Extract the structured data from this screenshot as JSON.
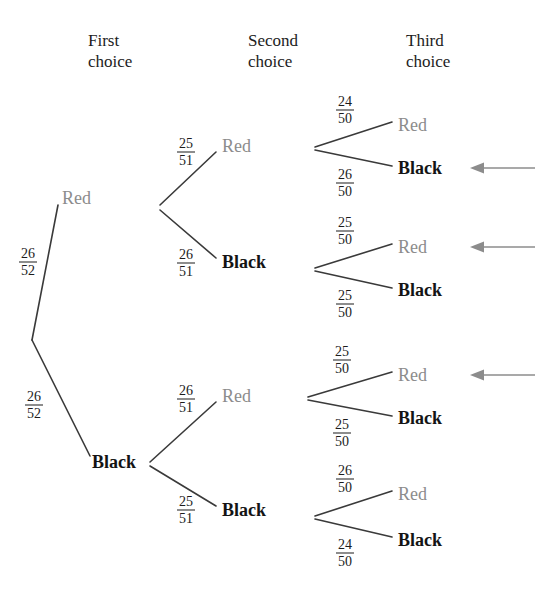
{
  "diagram": {
    "headers": [
      {
        "id": "first",
        "label": "First\nchoice",
        "x": 88,
        "y": 30
      },
      {
        "id": "second",
        "label": "Second\nchoice",
        "x": 248,
        "y": 30
      },
      {
        "id": "third",
        "label": "Third\nchoice",
        "x": 406,
        "y": 30
      }
    ],
    "colors": {
      "red_label": "#8c8c8c",
      "black_label": "#141414",
      "branch_line": "#3a3a3a",
      "arrow": "#8c8c8c",
      "background": "#ffffff"
    },
    "root": {
      "x": 32,
      "y": 340
    },
    "nodes": [
      {
        "id": "n1-red",
        "label": "Red",
        "kind": "red",
        "x": 62,
        "y": 198,
        "level": 1
      },
      {
        "id": "n1-black",
        "label": "Black",
        "kind": "black",
        "x": 92,
        "y": 462,
        "level": 1
      },
      {
        "id": "n2-rr",
        "label": "Red",
        "kind": "red",
        "x": 222,
        "y": 146,
        "level": 2
      },
      {
        "id": "n2-rb",
        "label": "Black",
        "kind": "black",
        "x": 222,
        "y": 262,
        "level": 2
      },
      {
        "id": "n2-br",
        "label": "Red",
        "kind": "red",
        "x": 222,
        "y": 396,
        "level": 2
      },
      {
        "id": "n2-bb",
        "label": "Black",
        "kind": "black",
        "x": 222,
        "y": 510,
        "level": 2
      },
      {
        "id": "n3-rrr",
        "label": "Red",
        "kind": "red",
        "x": 398,
        "y": 125,
        "level": 3
      },
      {
        "id": "n3-rrb",
        "label": "Black",
        "kind": "black",
        "x": 398,
        "y": 168,
        "level": 3
      },
      {
        "id": "n3-rbr",
        "label": "Red",
        "kind": "red",
        "x": 398,
        "y": 247,
        "level": 3
      },
      {
        "id": "n3-rbb",
        "label": "Black",
        "kind": "black",
        "x": 398,
        "y": 290,
        "level": 3
      },
      {
        "id": "n3-brr",
        "label": "Red",
        "kind": "red",
        "x": 398,
        "y": 375,
        "level": 3
      },
      {
        "id": "n3-brb",
        "label": "Black",
        "kind": "black",
        "x": 398,
        "y": 418,
        "level": 3
      },
      {
        "id": "n3-bbr",
        "label": "Red",
        "kind": "red",
        "x": 398,
        "y": 494,
        "level": 3
      },
      {
        "id": "n3-bbb",
        "label": "Black",
        "kind": "black",
        "x": 398,
        "y": 540,
        "level": 3
      }
    ],
    "branches": [
      {
        "id": "b-root-red",
        "from": [
          32,
          340
        ],
        "to": [
          58,
          205
        ],
        "numerator": "26",
        "denominator": "52",
        "label_x": 28,
        "label_y": 262
      },
      {
        "id": "b-root-black",
        "from": [
          32,
          340
        ],
        "to": [
          90,
          456
        ],
        "numerator": "26",
        "denominator": "52",
        "label_x": 34,
        "label_y": 405
      },
      {
        "id": "b-red-red",
        "from": [
          160,
          205
        ],
        "to": [
          216,
          152
        ],
        "numerator": "25",
        "denominator": "51",
        "label_x": 186,
        "label_y": 152
      },
      {
        "id": "b-red-black",
        "from": [
          160,
          210
        ],
        "to": [
          216,
          258
        ],
        "numerator": "26",
        "denominator": "51",
        "label_x": 186,
        "label_y": 263
      },
      {
        "id": "b-black-red",
        "from": [
          150,
          462
        ],
        "to": [
          216,
          402
        ],
        "numerator": "26",
        "denominator": "51",
        "label_x": 186,
        "label_y": 399
      },
      {
        "id": "b-black-black",
        "from": [
          150,
          466
        ],
        "to": [
          216,
          506
        ],
        "numerator": "25",
        "denominator": "51",
        "label_x": 186,
        "label_y": 510
      },
      {
        "id": "b-rr-red",
        "from": [
          315,
          147
        ],
        "to": [
          392,
          122
        ],
        "numerator": "24",
        "denominator": "50",
        "label_x": 345,
        "label_y": 110
      },
      {
        "id": "b-rr-black",
        "from": [
          315,
          150
        ],
        "to": [
          392,
          166
        ],
        "numerator": "26",
        "denominator": "50",
        "label_x": 345,
        "label_y": 183
      },
      {
        "id": "b-rb-red",
        "from": [
          315,
          268
        ],
        "to": [
          392,
          244
        ],
        "numerator": "25",
        "denominator": "50",
        "label_x": 345,
        "label_y": 231
      },
      {
        "id": "b-rb-black",
        "from": [
          315,
          271
        ],
        "to": [
          392,
          288
        ],
        "numerator": "25",
        "denominator": "50",
        "label_x": 345,
        "label_y": 304
      },
      {
        "id": "b-br-red",
        "from": [
          308,
          397
        ],
        "to": [
          392,
          372
        ],
        "numerator": "25",
        "denominator": "50",
        "label_x": 342,
        "label_y": 360
      },
      {
        "id": "b-br-black",
        "from": [
          308,
          400
        ],
        "to": [
          392,
          416
        ],
        "numerator": "25",
        "denominator": "50",
        "label_x": 342,
        "label_y": 433
      },
      {
        "id": "b-bb-red",
        "from": [
          315,
          516
        ],
        "to": [
          392,
          491
        ],
        "numerator": "26",
        "denominator": "50",
        "label_x": 345,
        "label_y": 479
      },
      {
        "id": "b-bb-black",
        "from": [
          315,
          519
        ],
        "to": [
          392,
          537
        ],
        "numerator": "24",
        "denominator": "50",
        "label_x": 345,
        "label_y": 553
      }
    ],
    "arrows": [
      {
        "id": "arrow-rrb",
        "points_to": "n3-rrb",
        "tail_x": 535,
        "tip_x": 470,
        "y": 168
      },
      {
        "id": "arrow-rbr",
        "points_to": "n3-rbr",
        "tail_x": 535,
        "tip_x": 470,
        "y": 247
      },
      {
        "id": "arrow-brr",
        "points_to": "n3-brr",
        "tail_x": 535,
        "tip_x": 470,
        "y": 375
      }
    ]
  }
}
